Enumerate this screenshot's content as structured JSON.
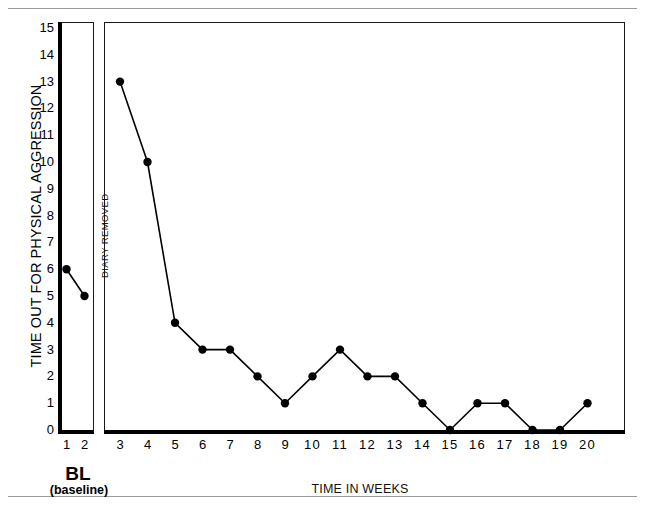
{
  "figure": {
    "ylabel": "TIME OUT FOR PHYSICAL AGGRESSION",
    "xlabel": "TIME IN WEEKS",
    "phase_label": "DIARY REMOVED",
    "baseline_title": "BL",
    "baseline_subtitle": "(baseline)"
  },
  "chart_data": {
    "type": "line",
    "title": "",
    "xlabel": "TIME IN WEEKS",
    "ylabel": "TIME OUT FOR PHYSICAL AGGRESSION",
    "xlim": [
      1,
      20
    ],
    "ylim": [
      0,
      15
    ],
    "grid": false,
    "legend": null,
    "marker": "filled-circle",
    "annotations": [
      {
        "text": "DIARY REMOVED",
        "orientation": "vertical",
        "position": "phase-change-line-between-week-2-and-3"
      },
      {
        "text": "BL",
        "position": "below-baseline-panel"
      },
      {
        "text": "(baseline)",
        "position": "below-baseline-panel"
      }
    ],
    "ytick_labels": [
      "0",
      "1",
      "2",
      "3",
      "4",
      "5",
      "6",
      "7",
      "8",
      "9",
      "10",
      "11",
      "12",
      "13",
      "14",
      "15"
    ],
    "xtick_labels": [
      "1",
      "2",
      "3",
      "4",
      "5",
      "6",
      "7",
      "8",
      "9",
      "10",
      "11",
      "12",
      "13",
      "14",
      "15",
      "16",
      "17",
      "18",
      "19",
      "20"
    ],
    "phases": [
      {
        "name": "BL",
        "long_name": "(baseline)",
        "x": [
          1,
          2
        ],
        "values": [
          6,
          5
        ]
      },
      {
        "name": "DIARY REMOVED",
        "x": [
          3,
          4,
          5,
          6,
          7,
          8,
          9,
          10,
          11,
          12,
          13,
          14,
          15,
          16,
          17,
          18,
          19,
          20
        ],
        "values": [
          13,
          10,
          4,
          3,
          3,
          2,
          1,
          2,
          3,
          2,
          2,
          1,
          0,
          1,
          1,
          0,
          0,
          1
        ]
      }
    ],
    "x": [
      1,
      2,
      3,
      4,
      5,
      6,
      7,
      8,
      9,
      10,
      11,
      12,
      13,
      14,
      15,
      16,
      17,
      18,
      19,
      20
    ],
    "values": [
      6,
      5,
      13,
      10,
      4,
      3,
      3,
      2,
      1,
      2,
      3,
      2,
      2,
      1,
      0,
      1,
      1,
      0,
      0,
      1
    ]
  },
  "colors": {
    "line": "#000000",
    "marker": "#000000",
    "axis": "#000000",
    "frame": "#1a1a1a",
    "rule": "#9a9a9a",
    "background": "#ffffff"
  }
}
